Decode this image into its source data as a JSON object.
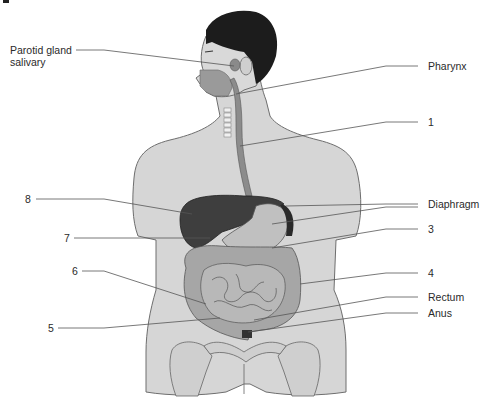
{
  "figure": {
    "colors": {
      "skin": "#d4d4d4",
      "outline": "#6e6e6e",
      "hair": "#1a1a1a",
      "liver": "#3a3a3a",
      "stomach": "#bdbdbd",
      "intestine": "#9a9a9a",
      "leader_line": "#555555",
      "text": "#2a2a2a"
    }
  },
  "labels": {
    "parotid_line1": "Parotid gland",
    "parotid_line2": "salivary",
    "pharynx": "Pharynx",
    "n1": "1",
    "diaphragm": "Diaphragm",
    "n2": "2",
    "n3": "3",
    "n4": "4",
    "rectum": "Rectum",
    "anus": "Anus",
    "n8": "8",
    "n7": "7",
    "n6": "6",
    "n5": "5"
  }
}
